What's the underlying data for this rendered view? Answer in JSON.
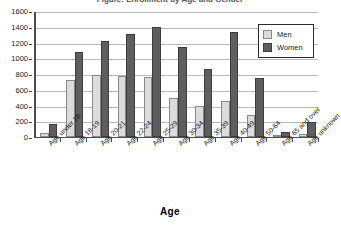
{
  "chart_data": {
    "type": "bar",
    "title": "Figure: Enrollment by Age and Gender",
    "xlabel": "Age",
    "ylabel": "",
    "ylim": [
      0,
      1600
    ],
    "ytick_step": 200,
    "yticks": [
      0,
      200,
      400,
      600,
      800,
      1000,
      1200,
      1400,
      1600
    ],
    "grid": true,
    "legend_position": "top-right",
    "categories": [
      "Age under 18",
      "Age 18-19",
      "Age 20-21",
      "Age 22-24",
      "Age 25-29",
      "Age 30-34",
      "Age 35-39",
      "Age 40-49",
      "Age 50-64",
      "Age 65 and over",
      "Age unknown"
    ],
    "series": [
      {
        "name": "Men",
        "color": "#dcdcdc",
        "values": [
          50,
          720,
          790,
          770,
          760,
          490,
          390,
          460,
          280,
          30,
          40
        ]
      },
      {
        "name": "Women",
        "color": "#5e5e5e",
        "values": [
          170,
          1080,
          1220,
          1310,
          1400,
          1140,
          870,
          1330,
          750,
          60,
          190
        ]
      }
    ]
  },
  "legend": {
    "items": [
      {
        "label": "Men",
        "swatch": "men"
      },
      {
        "label": "Women",
        "swatch": "women"
      }
    ]
  }
}
